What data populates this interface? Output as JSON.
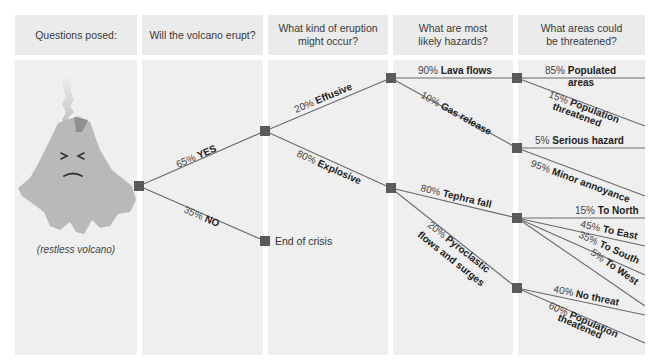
{
  "headers": [
    "Questions posed:",
    "Will the volcano erupt?",
    "What kind of eruption might occur?",
    "What are most likely hazards?",
    "What areas could be threatened?"
  ],
  "volcano": {
    "caption": "(restless volcano)",
    "icon": "angry-volcano-icon"
  },
  "colors": {
    "column_bg": "#efefef",
    "header_bg": "#ebebeb",
    "node": "#5a5a5a",
    "line": "#666666",
    "volcano": "#b9b9b9"
  },
  "tree": {
    "erupt": [
      {
        "pct": "65%",
        "label": "YES"
      },
      {
        "pct": "35%",
        "label": "NO",
        "outcome": "End of crisis"
      }
    ],
    "eruption_type": [
      {
        "pct": "20%",
        "label": "Effusive"
      },
      {
        "pct": "80%",
        "label": "Explosive"
      }
    ],
    "effusive_hazards": [
      {
        "pct": "90%",
        "label": "Lava flows"
      },
      {
        "pct": "10%",
        "label": "Gas release"
      }
    ],
    "explosive_hazards": [
      {
        "pct": "80%",
        "label": "Tephra fall"
      },
      {
        "pct": "20%",
        "label": "Pyroclastic",
        "label2": "flows and surges"
      }
    ],
    "lava_areas": [
      {
        "pct": "85%",
        "label": "Populated",
        "label2": "areas"
      },
      {
        "pct": "15%",
        "label": "Population",
        "label2": "threatened"
      }
    ],
    "gas_areas": [
      {
        "pct": "5%",
        "label": "Serious hazard"
      },
      {
        "pct": "95%",
        "label": "Minor annoyance"
      }
    ],
    "tephra_areas": [
      {
        "pct": "15%",
        "label": "To North"
      },
      {
        "pct": "45%",
        "label": "To East"
      },
      {
        "pct": "35%",
        "label": "To South"
      },
      {
        "pct": "5%",
        "label": "To West"
      }
    ],
    "pyro_areas": [
      {
        "pct": "40%",
        "label": "No threat"
      },
      {
        "pct": "60%",
        "label": "Population",
        "label2": "theatened"
      }
    ]
  }
}
